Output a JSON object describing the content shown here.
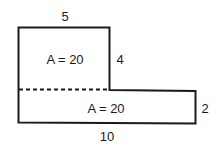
{
  "diagram": {
    "type": "composite-area-figure",
    "colors": {
      "stroke": "#1a1a1a",
      "background": "#ffffff"
    },
    "shapes": [
      {
        "name": "upper-rectangle",
        "width_label": "5",
        "height_label": "4",
        "area_label": "A = 20"
      },
      {
        "name": "lower-rectangle",
        "width_label": "10",
        "height_label": "2",
        "area_label": "A = 20"
      }
    ],
    "dimensions": {
      "top": "5",
      "right_upper": "4",
      "right_lower": "2",
      "bottom": "10"
    },
    "divider": "dashed"
  }
}
